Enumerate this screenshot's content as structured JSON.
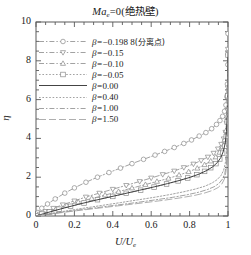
{
  "chart_data": {
    "type": "line",
    "title_parts": {
      "symbol": "Ma",
      "subscript": "e",
      "equals_value": "=0",
      "paren": "(绝热壁)"
    },
    "xlabel": "U/U_e",
    "xlabel_parts": {
      "main": "U/U",
      "subscript": "e"
    },
    "ylabel": "η",
    "xlim": [
      0,
      1
    ],
    "ylim": [
      0,
      10
    ],
    "xticks": [
      "0",
      "0.2",
      "0.4",
      "0.6",
      "0.8",
      "1"
    ],
    "xtick_values": [
      0,
      0.2,
      0.4,
      0.6,
      0.8,
      1
    ],
    "yticks": [
      "0",
      "2",
      "4",
      "6",
      "8",
      "10"
    ],
    "ytick_values": [
      0,
      2,
      4,
      6,
      8,
      10
    ],
    "grid": false,
    "legend_position": "upper-left",
    "minor_ticks": true,
    "series": [
      {
        "name": "β=−0.198 8(分离点)",
        "beta": -0.1988,
        "marker": "circle",
        "linestyle": "dashdot",
        "color": "#8a8a8a",
        "x": [
          0,
          0.01,
          0.03,
          0.06,
          0.1,
          0.15,
          0.2,
          0.26,
          0.32,
          0.38,
          0.44,
          0.5,
          0.56,
          0.62,
          0.67,
          0.72,
          0.77,
          0.81,
          0.85,
          0.885,
          0.915,
          0.94,
          0.958,
          0.972,
          0.982,
          0.989,
          0.994,
          0.997,
          0.999,
          1.0
        ],
        "y": [
          0,
          0.18,
          0.4,
          0.62,
          0.88,
          1.18,
          1.45,
          1.74,
          2.0,
          2.24,
          2.47,
          2.7,
          2.92,
          3.14,
          3.33,
          3.53,
          3.74,
          3.92,
          4.12,
          4.3,
          4.5,
          4.72,
          4.92,
          5.14,
          5.4,
          5.72,
          6.15,
          6.8,
          7.8,
          9.4
        ]
      },
      {
        "name": "β=−0.15",
        "beta": -0.15,
        "marker": "triangle-down",
        "linestyle": "dashdot",
        "color": "#8a8a8a",
        "x": [
          0,
          0.02,
          0.05,
          0.09,
          0.14,
          0.2,
          0.26,
          0.33,
          0.4,
          0.47,
          0.54,
          0.6,
          0.66,
          0.72,
          0.77,
          0.82,
          0.86,
          0.895,
          0.925,
          0.948,
          0.965,
          0.978,
          0.987,
          0.993,
          0.997,
          0.999,
          1.0
        ],
        "y": [
          0,
          0.1,
          0.24,
          0.4,
          0.58,
          0.78,
          0.98,
          1.18,
          1.38,
          1.58,
          1.78,
          1.96,
          2.14,
          2.32,
          2.5,
          2.68,
          2.86,
          3.04,
          3.24,
          3.46,
          3.7,
          3.98,
          4.32,
          4.78,
          5.45,
          6.6,
          8.6
        ]
      },
      {
        "name": "β=−0.10",
        "beta": -0.1,
        "marker": "triangle-up",
        "linestyle": "dashdot",
        "color": "#8a8a8a",
        "x": [
          0,
          0.025,
          0.06,
          0.105,
          0.16,
          0.22,
          0.29,
          0.36,
          0.43,
          0.5,
          0.57,
          0.63,
          0.69,
          0.745,
          0.795,
          0.84,
          0.878,
          0.91,
          0.936,
          0.956,
          0.971,
          0.982,
          0.99,
          0.995,
          0.998,
          1.0
        ],
        "y": [
          0,
          0.1,
          0.22,
          0.37,
          0.54,
          0.72,
          0.9,
          1.08,
          1.26,
          1.44,
          1.62,
          1.78,
          1.94,
          2.11,
          2.28,
          2.46,
          2.64,
          2.83,
          3.04,
          3.28,
          3.56,
          3.92,
          4.4,
          5.15,
          6.35,
          8.4
        ]
      },
      {
        "name": "β=−0.05",
        "beta": -0.05,
        "marker": "square",
        "linestyle": "dotted",
        "color": "#8a8a8a",
        "x": [
          0,
          0.03,
          0.07,
          0.12,
          0.18,
          0.25,
          0.32,
          0.4,
          0.47,
          0.545,
          0.615,
          0.68,
          0.74,
          0.79,
          0.838,
          0.878,
          0.91,
          0.937,
          0.957,
          0.972,
          0.983,
          0.991,
          0.996,
          0.999,
          1.0
        ],
        "y": [
          0,
          0.1,
          0.21,
          0.35,
          0.5,
          0.67,
          0.84,
          1.01,
          1.17,
          1.33,
          1.49,
          1.65,
          1.81,
          1.96,
          2.13,
          2.3,
          2.49,
          2.7,
          2.94,
          3.24,
          3.6,
          4.1,
          4.85,
          6.2,
          8.3
        ]
      },
      {
        "name": "β=0.00",
        "beta": 0.0,
        "marker": "none",
        "linestyle": "solid",
        "color": "#3a3a3a",
        "x": [
          0,
          0.04,
          0.09,
          0.15,
          0.22,
          0.3,
          0.38,
          0.46,
          0.54,
          0.615,
          0.685,
          0.75,
          0.805,
          0.852,
          0.89,
          0.921,
          0.945,
          0.963,
          0.976,
          0.986,
          0.992,
          0.996,
          0.999,
          1.0
        ],
        "y": [
          0,
          0.12,
          0.26,
          0.42,
          0.6,
          0.79,
          0.97,
          1.15,
          1.33,
          1.5,
          1.67,
          1.84,
          2.0,
          2.17,
          2.35,
          2.54,
          2.76,
          3.02,
          3.34,
          3.78,
          4.35,
          5.2,
          6.6,
          8.4
        ]
      },
      {
        "name": "β=0.40",
        "beta": 0.4,
        "marker": "none",
        "linestyle": "dotted",
        "color": "#8a8a8a",
        "x": [
          0,
          0.07,
          0.15,
          0.24,
          0.34,
          0.44,
          0.53,
          0.62,
          0.7,
          0.77,
          0.83,
          0.878,
          0.915,
          0.943,
          0.963,
          0.977,
          0.986,
          0.992,
          0.996,
          0.999,
          1.0
        ],
        "y": [
          0,
          0.12,
          0.25,
          0.39,
          0.54,
          0.69,
          0.83,
          0.97,
          1.11,
          1.25,
          1.39,
          1.53,
          1.69,
          1.87,
          2.08,
          2.35,
          2.72,
          3.25,
          4.1,
          5.7,
          7.9
        ]
      },
      {
        "name": "β=1.00",
        "beta": 1.0,
        "marker": "none",
        "linestyle": "dashdot",
        "color": "#8a8a8a",
        "x": [
          0,
          0.09,
          0.19,
          0.3,
          0.41,
          0.52,
          0.62,
          0.71,
          0.785,
          0.845,
          0.892,
          0.928,
          0.953,
          0.971,
          0.983,
          0.991,
          0.996,
          0.999,
          1.0
        ],
        "y": [
          0,
          0.13,
          0.27,
          0.41,
          0.55,
          0.69,
          0.83,
          0.96,
          1.09,
          1.22,
          1.36,
          1.51,
          1.68,
          1.9,
          2.18,
          2.6,
          3.3,
          4.8,
          7.4
        ]
      },
      {
        "name": "β=1.50",
        "beta": 1.5,
        "marker": "none",
        "linestyle": "longdash",
        "color": "#9a9a9a",
        "x": [
          0,
          0.1,
          0.21,
          0.33,
          0.45,
          0.56,
          0.665,
          0.755,
          0.825,
          0.88,
          0.92,
          0.949,
          0.968,
          0.981,
          0.989,
          0.995,
          0.998,
          1.0
        ],
        "y": [
          0,
          0.13,
          0.27,
          0.41,
          0.55,
          0.68,
          0.81,
          0.94,
          1.06,
          1.19,
          1.32,
          1.47,
          1.65,
          1.9,
          2.25,
          2.85,
          4.1,
          6.9
        ]
      }
    ]
  },
  "legend": {
    "entries": [
      {
        "prefix": "β=",
        "value": "−0.198 8",
        "note": "(分离点)"
      },
      {
        "prefix": "β=",
        "value": "−0.15",
        "note": ""
      },
      {
        "prefix": "β=",
        "value": "−0.10",
        "note": ""
      },
      {
        "prefix": "β=",
        "value": "−0.05",
        "note": ""
      },
      {
        "prefix": "β=",
        "value": "0.00",
        "note": ""
      },
      {
        "prefix": "β=",
        "value": "0.40",
        "note": ""
      },
      {
        "prefix": "β=",
        "value": "1.00",
        "note": ""
      },
      {
        "prefix": "β=",
        "value": "1.50",
        "note": ""
      }
    ]
  },
  "colors": {
    "axis": "#5a5a5a",
    "curve_main": "#3a3a3a",
    "curve_light": "#8a8a8a",
    "text": "#1a1a1a",
    "background": "#ffffff"
  }
}
